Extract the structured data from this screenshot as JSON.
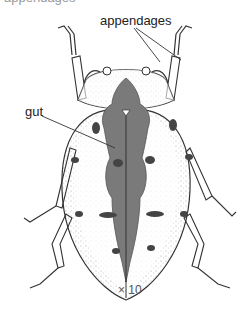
{
  "figure": {
    "top_text_fragment": "appendages",
    "labels": {
      "appendages": "appendages",
      "gut": "gut"
    },
    "magnification": "× 10",
    "colors": {
      "gut": "#7a7a7a",
      "outline": "#333333",
      "stipple": "#8a8a8a",
      "background": "#ffffff"
    }
  }
}
